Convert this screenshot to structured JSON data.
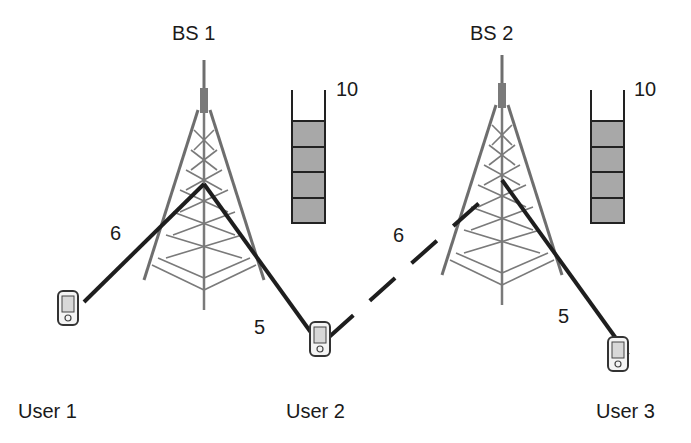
{
  "base_stations": [
    {
      "label": "BS 1",
      "queue_capacity_label": "10",
      "queue_filled_slots": 4
    },
    {
      "label": "BS 2",
      "queue_capacity_label": "10",
      "queue_filled_slots": 4
    }
  ],
  "users": [
    {
      "label": "User 1"
    },
    {
      "label": "User 2"
    },
    {
      "label": "User 3"
    }
  ],
  "links": [
    {
      "from": "User 1",
      "to": "BS 1",
      "weight": "6",
      "style": "solid"
    },
    {
      "from": "User 2",
      "to": "BS 1",
      "weight": "5",
      "style": "solid"
    },
    {
      "from": "User 2",
      "to": "BS 2",
      "weight": "6",
      "style": "dashed"
    },
    {
      "from": "User 3",
      "to": "BS 2",
      "weight": "5",
      "style": "solid"
    }
  ],
  "colors": {
    "tower": "#6e6e6e",
    "link": "#1e1e1e",
    "queue_fill": "#a8a8a8",
    "queue_border": "#222222"
  }
}
